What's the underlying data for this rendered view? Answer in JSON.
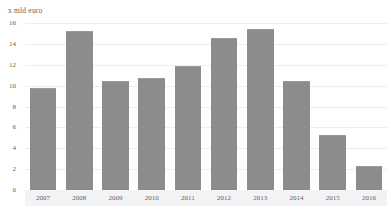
{
  "chart_data": {
    "type": "bar",
    "title": "",
    "subtitle": "",
    "xlabel": "",
    "ylabel": "x mld euro",
    "unit_label": "x mld euro",
    "categories": [
      "2007",
      "2008",
      "2009",
      "2010",
      "2011",
      "2012",
      "2013",
      "2014",
      "2015",
      "2016"
    ],
    "values": [
      9.8,
      15.2,
      10.4,
      10.7,
      11.9,
      14.6,
      15.4,
      10.4,
      5.3,
      2.3
    ],
    "series": [
      {
        "name": "x mld euro",
        "values": [
          9.8,
          15.2,
          10.4,
          10.7,
          11.9,
          14.6,
          15.4,
          10.4,
          5.3,
          2.3
        ]
      }
    ],
    "ylim": [
      0,
      16
    ],
    "ytick_labels": [
      "0",
      "2",
      "4",
      "6",
      "8",
      "10",
      "12",
      "14",
      "16"
    ],
    "ytick_values": [
      0,
      2,
      4,
      6,
      8,
      10,
      12,
      14,
      16
    ],
    "grid": true,
    "grid_axis": "y",
    "legend": false,
    "legend_position": "none",
    "bar_color": "#8c8c8c",
    "grid_color": "#ededf2",
    "axis_color": "#d9d9de",
    "text_color": "#5f5f5f",
    "background_color": "#ffffff",
    "xaxis_band_color": "#f3f3f5"
  }
}
